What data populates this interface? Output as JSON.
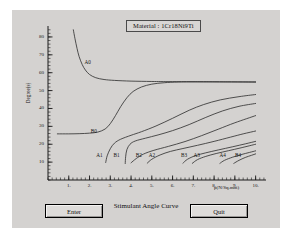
{
  "window": {
    "background_color": "#d4d2d0"
  },
  "chart_title": "Material : 1Cr18Ni9Ti",
  "buttons": {
    "enter_label": "Enter",
    "quit_label": "Quit"
  },
  "chart_data": {
    "type": "line",
    "title": "Material : 1Cr18Ni9Ti",
    "caption": "Stimulant Angle Curve",
    "xlabel": "p(N/Sq.mm)",
    "ylabel": "Degree(s)",
    "xlim": [
      0,
      10.5
    ],
    "ylim": [
      0,
      85
    ],
    "grid": false,
    "legend_position": "inline-annotations",
    "x_ticks": [
      1,
      2,
      3,
      4,
      5,
      6,
      7,
      8,
      9,
      10
    ],
    "x_tick_labels": [
      "1.",
      "2.",
      "3.",
      "4.",
      "5.",
      "6.",
      "7.",
      "8.",
      "9.",
      "10."
    ],
    "y_ticks": [
      10,
      20,
      30,
      40,
      50,
      60,
      70,
      80
    ],
    "y_tick_labels": [
      "10",
      "20",
      "30",
      "40",
      "50",
      "60",
      "70",
      "80"
    ],
    "x_minor_tick_step": 0.2,
    "y_minor_tick_step": 2,
    "line_color": "#2b2b2b",
    "axis_color": "#1a1a1a",
    "series": [
      {
        "name": "A0",
        "label": "A0",
        "label_x": 1.95,
        "label_y": 66,
        "points": [
          [
            1.22,
            84.0
          ],
          [
            1.3,
            79.0
          ],
          [
            1.4,
            73.5
          ],
          [
            1.5,
            69.0
          ],
          [
            1.65,
            64.5
          ],
          [
            1.8,
            61.5
          ],
          [
            2.0,
            59.0
          ],
          [
            2.3,
            57.2
          ],
          [
            2.7,
            56.2
          ],
          [
            3.2,
            55.7
          ],
          [
            4.0,
            55.3
          ],
          [
            5.0,
            55.1
          ],
          [
            6.0,
            55.0
          ],
          [
            8.0,
            54.9
          ],
          [
            10.0,
            54.8
          ]
        ]
      },
      {
        "name": "B0",
        "label": "B0",
        "label_x": 2.25,
        "label_y": 27.5,
        "points": [
          [
            0.45,
            25.8
          ],
          [
            1.0,
            25.8
          ],
          [
            1.5,
            25.9
          ],
          [
            2.0,
            26.2
          ],
          [
            2.4,
            26.8
          ],
          [
            2.75,
            28.5
          ],
          [
            3.0,
            31.5
          ],
          [
            3.25,
            36.0
          ],
          [
            3.5,
            41.0
          ],
          [
            3.8,
            46.0
          ],
          [
            4.1,
            49.5
          ],
          [
            4.5,
            52.0
          ],
          [
            5.0,
            53.6
          ],
          [
            5.6,
            54.4
          ],
          [
            6.3,
            54.8
          ],
          [
            7.5,
            54.9
          ],
          [
            10.0,
            54.8
          ]
        ]
      },
      {
        "name": "A1",
        "label": "A1",
        "label_x": 2.52,
        "label_y": 13.8,
        "points": [
          [
            2.78,
            9.8
          ],
          [
            2.85,
            13.5
          ],
          [
            3.0,
            17.5
          ],
          [
            3.2,
            20.6
          ],
          [
            3.5,
            22.8
          ],
          [
            4.0,
            25.0
          ],
          [
            4.5,
            27.0
          ],
          [
            5.2,
            30.2
          ],
          [
            6.0,
            34.5
          ],
          [
            6.8,
            39.0
          ],
          [
            7.5,
            42.2
          ],
          [
            8.3,
            44.8
          ],
          [
            9.2,
            46.6
          ],
          [
            10.0,
            47.8
          ]
        ]
      },
      {
        "name": "B1",
        "label": "B1",
        "label_x": 3.35,
        "label_y": 13.8,
        "points": [
          [
            3.72,
            9.2
          ],
          [
            3.74,
            13.0
          ],
          [
            3.8,
            17.0
          ],
          [
            3.95,
            20.0
          ],
          [
            4.2,
            21.8
          ],
          [
            4.7,
            23.4
          ],
          [
            5.3,
            25.2
          ],
          [
            6.0,
            27.6
          ],
          [
            6.8,
            31.0
          ],
          [
            7.6,
            35.0
          ],
          [
            8.4,
            38.6
          ],
          [
            9.2,
            41.2
          ],
          [
            10.0,
            42.8
          ]
        ]
      },
      {
        "name": "B2",
        "label": "B2",
        "label_x": 4.42,
        "label_y": 13.8,
        "points": [
          [
            4.0,
            9.6
          ],
          [
            4.25,
            12.0
          ],
          [
            4.6,
            14.5
          ],
          [
            5.1,
            16.6
          ],
          [
            5.8,
            18.8
          ],
          [
            6.6,
            21.5
          ],
          [
            7.4,
            24.8
          ],
          [
            8.2,
            28.4
          ],
          [
            9.0,
            32.0
          ],
          [
            10.0,
            36.0
          ]
        ]
      },
      {
        "name": "A2",
        "label": "A2",
        "label_x": 5.05,
        "label_y": 13.8,
        "points": [
          [
            4.78,
            9.4
          ],
          [
            5.0,
            11.6
          ],
          [
            5.4,
            14.0
          ],
          [
            5.9,
            16.0
          ],
          [
            6.5,
            17.6
          ],
          [
            7.2,
            19.4
          ],
          [
            8.0,
            21.6
          ],
          [
            8.8,
            24.0
          ],
          [
            9.4,
            25.8
          ],
          [
            10.0,
            27.4
          ]
        ]
      },
      {
        "name": "B3",
        "label": "B3",
        "label_x": 6.6,
        "label_y": 13.8,
        "points": [
          [
            6.5,
            9.4
          ],
          [
            6.72,
            11.6
          ],
          [
            7.1,
            13.6
          ],
          [
            7.6,
            15.2
          ],
          [
            8.2,
            16.8
          ],
          [
            8.9,
            18.6
          ],
          [
            9.5,
            20.2
          ],
          [
            10.0,
            21.6
          ]
        ]
      },
      {
        "name": "A3",
        "label": "A3",
        "label_x": 7.2,
        "label_y": 13.8,
        "points": [
          [
            6.95,
            9.3
          ],
          [
            7.2,
            11.4
          ],
          [
            7.6,
            13.2
          ],
          [
            8.1,
            14.8
          ],
          [
            8.7,
            16.4
          ],
          [
            9.3,
            18.0
          ],
          [
            10.0,
            20.0
          ]
        ]
      },
      {
        "name": "A4",
        "label": "A4",
        "label_x": 8.45,
        "label_y": 13.8,
        "points": [
          [
            8.28,
            9.3
          ],
          [
            8.5,
            11.0
          ],
          [
            8.9,
            12.8
          ],
          [
            9.3,
            14.2
          ],
          [
            9.7,
            15.4
          ],
          [
            10.0,
            16.3
          ]
        ]
      },
      {
        "name": "B4",
        "label": "B4",
        "label_x": 9.2,
        "label_y": 13.8,
        "points": [
          [
            8.95,
            9.3
          ],
          [
            9.2,
            11.0
          ],
          [
            9.5,
            12.6
          ],
          [
            9.8,
            13.8
          ],
          [
            10.0,
            14.6
          ]
        ]
      }
    ]
  }
}
